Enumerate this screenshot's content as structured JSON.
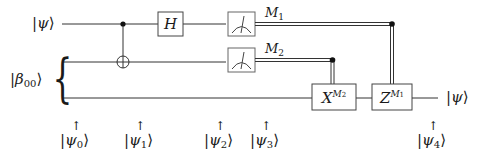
{
  "diagram": {
    "inputs": {
      "top": {
        "symbol": "ψ",
        "sub": ""
      },
      "pair": {
        "symbol": "β",
        "sub": "00"
      }
    },
    "output": {
      "symbol": "ψ",
      "sub": ""
    },
    "gates": {
      "hadamard": "H",
      "x_gate": {
        "base": "X",
        "sup": "M",
        "sup_sub": "2"
      },
      "z_gate": {
        "base": "Z",
        "sup": "M",
        "sup_sub": "1"
      }
    },
    "measurements": [
      {
        "label": "M",
        "sub": "1"
      },
      {
        "label": "M",
        "sub": "2"
      }
    ],
    "states": [
      {
        "symbol": "ψ",
        "sub": "0"
      },
      {
        "symbol": "ψ",
        "sub": "1"
      },
      {
        "symbol": "ψ",
        "sub": "2"
      },
      {
        "symbol": "ψ",
        "sub": "3"
      },
      {
        "symbol": "ψ",
        "sub": "4"
      }
    ],
    "arrow_glyph": "↑",
    "ket_left": "|",
    "ket_right": "⟩",
    "brace": "{"
  }
}
